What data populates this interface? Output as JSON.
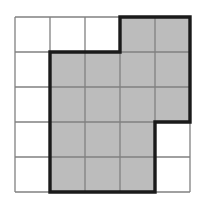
{
  "figure": {
    "title": "",
    "type": "grid-shaded-region",
    "grid": {
      "columns": 5,
      "rows": 5,
      "cell_size": 35,
      "origin_x": 15,
      "origin_y": 17,
      "column_lines_x": [
        15,
        50,
        85,
        120,
        155,
        190
      ],
      "row_lines_y": [
        17,
        52,
        87,
        122,
        157,
        192
      ]
    },
    "colors": {
      "shaded_fill": "#bcbcbc",
      "grid_line": "#808080",
      "outline": "#1a1a1a",
      "background": "#ffffff"
    },
    "line_widths": {
      "grid_line": 1.3,
      "outline": 3.4
    },
    "shaded_cells": [
      {
        "row": 1,
        "col": 4
      },
      {
        "row": 1,
        "col": 5
      },
      {
        "row": 2,
        "col": 2
      },
      {
        "row": 2,
        "col": 3
      },
      {
        "row": 2,
        "col": 4
      },
      {
        "row": 2,
        "col": 5
      },
      {
        "row": 3,
        "col": 2
      },
      {
        "row": 3,
        "col": 3
      },
      {
        "row": 3,
        "col": 4
      },
      {
        "row": 3,
        "col": 5
      },
      {
        "row": 4,
        "col": 2
      },
      {
        "row": 4,
        "col": 3
      },
      {
        "row": 4,
        "col": 4
      },
      {
        "row": 5,
        "col": 2
      },
      {
        "row": 5,
        "col": 3
      },
      {
        "row": 5,
        "col": 4
      }
    ],
    "shaded_cell_count": 16,
    "outline_path_points": [
      [
        120,
        17
      ],
      [
        190,
        17
      ],
      [
        190,
        122
      ],
      [
        155,
        122
      ],
      [
        155,
        192
      ],
      [
        50,
        192
      ],
      [
        50,
        52
      ],
      [
        120,
        52
      ],
      [
        120,
        17
      ]
    ],
    "row_shading_summary": [
      {
        "row": 1,
        "shaded_columns": [
          4,
          5
        ],
        "count": 2
      },
      {
        "row": 2,
        "shaded_columns": [
          2,
          3,
          4,
          5
        ],
        "count": 4
      },
      {
        "row": 3,
        "shaded_columns": [
          2,
          3,
          4,
          5
        ],
        "count": 4
      },
      {
        "row": 4,
        "shaded_columns": [
          2,
          3,
          4
        ],
        "count": 3
      },
      {
        "row": 5,
        "shaded_columns": [
          2,
          3,
          4
        ],
        "count": 3
      }
    ]
  }
}
